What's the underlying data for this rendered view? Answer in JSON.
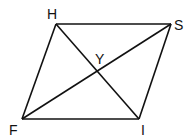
{
  "diagram": {
    "type": "parallelogram-with-diagonals",
    "stroke_color": "#111111",
    "vertices": [
      {
        "label": "H",
        "x": 56,
        "y": 24,
        "lx": 47,
        "ly": 19
      },
      {
        "label": "S",
        "x": 171,
        "y": 24,
        "lx": 174,
        "ly": 30
      },
      {
        "label": "I",
        "x": 139,
        "y": 119,
        "lx": 141,
        "ly": 135
      },
      {
        "label": "F",
        "x": 22,
        "y": 119,
        "lx": 9,
        "ly": 135
      }
    ],
    "intersection": {
      "label": "Y",
      "x": 97,
      "y": 72,
      "lx": 95,
      "ly": 64
    },
    "edges": [
      [
        "H",
        "S"
      ],
      [
        "S",
        "I"
      ],
      [
        "I",
        "F"
      ],
      [
        "F",
        "H"
      ]
    ],
    "diagonals": [
      [
        "H",
        "I"
      ],
      [
        "F",
        "S"
      ]
    ]
  }
}
